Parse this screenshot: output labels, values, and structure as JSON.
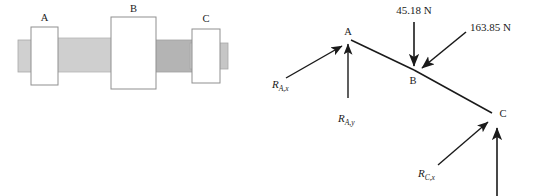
{
  "figure": {
    "title": "",
    "colors": {
      "shaft_light": "#d2d2d2",
      "shaft_mid": "#c3c3c3",
      "shaft_dark": "#b0b0b0",
      "collar_fill": "#ffffff",
      "outline": "#8f8f8f",
      "ink": "#1a1a1a"
    }
  },
  "shaft_diagram": {
    "name": "shaft-assembly",
    "collars": [
      {
        "id": "A",
        "label": "A"
      },
      {
        "id": "B",
        "label": "B"
      },
      {
        "id": "C",
        "label": "C"
      }
    ]
  },
  "force_diagram": {
    "name": "free-body-diagram",
    "nodes": [
      {
        "id": "A",
        "label": "A"
      },
      {
        "id": "B",
        "label": "B"
      },
      {
        "id": "C",
        "label": "C"
      }
    ],
    "applied_loads": [
      {
        "id": "load-b-vertical",
        "label": "45.18 N",
        "value": 45.18,
        "unit": "N",
        "at": "B",
        "direction": "down"
      },
      {
        "id": "load-b-diagonal",
        "label": "163.85 N",
        "value": 163.85,
        "unit": "N",
        "at": "B",
        "direction": "down-left"
      }
    ],
    "reactions": [
      {
        "id": "R-Ax",
        "symbol": "R",
        "subscript": "A,x",
        "at": "A",
        "direction": "up-right"
      },
      {
        "id": "R-Ay",
        "symbol": "R",
        "subscript": "A,y",
        "at": "A",
        "direction": "up"
      },
      {
        "id": "R-Cx",
        "symbol": "R",
        "subscript": "C,x",
        "at": "C",
        "direction": "up-right"
      },
      {
        "id": "R-Cy",
        "symbol": "",
        "subscript": "",
        "at": "C",
        "direction": "up"
      }
    ]
  }
}
